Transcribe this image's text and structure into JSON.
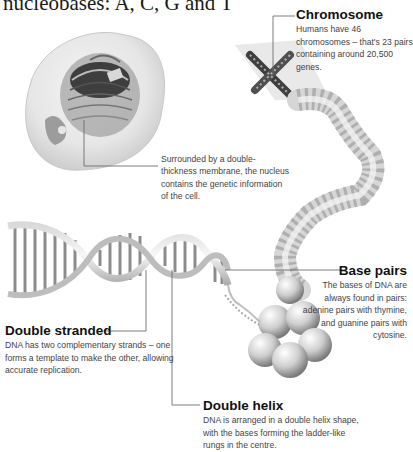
{
  "heading": {
    "text": "nucleobases: A, C, G and T"
  },
  "callouts": {
    "chromosome": {
      "title": "Chromosome",
      "body": "Humans have 46 chromosomes – that's 23 pairs containing around 20,500 genes."
    },
    "nucleus": {
      "title": "",
      "body": "Surrounded by a double-thickness membrane, the nucleus contains the genetic information of the cell."
    },
    "base_pairs": {
      "title": "Base pairs",
      "body": "The bases of DNA are always found in pairs: adenine pairs with thymine, and guanine pairs with cytosine."
    },
    "double_stranded": {
      "title": "Double stranded",
      "body": "DNA has two complementary strands – one forms a template to make the other, allowing accurate replication."
    },
    "double_helix": {
      "title": "Double helix",
      "body": "DNA is arranged in a double helix shape, with the bases forming the ladder-like rungs in the centre."
    }
  },
  "illustrations": {
    "cell": "cell-with-nucleus-illustration",
    "chromosome": "x-shaped-chromosome-illustration",
    "chromatin": "coiled-chromatin-illustration",
    "histones": "histone-spheres-illustration",
    "dna": "dna-double-helix-illustration"
  },
  "colors": {
    "leader_line": "#6e6e6e",
    "text_title": "#111111",
    "text_body": "#444444",
    "art_gray": "#9a9a9a"
  }
}
